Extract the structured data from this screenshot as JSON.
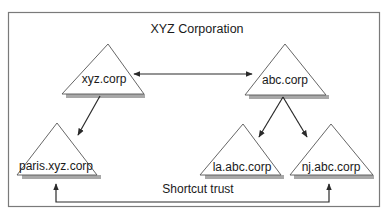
{
  "diagram": {
    "title": "XYZ Corporation",
    "nodes": [
      {
        "id": "xyz",
        "label": "xyz.corp"
      },
      {
        "id": "abc",
        "label": "abc.corp"
      },
      {
        "id": "paris",
        "label": "paris.xyz.corp"
      },
      {
        "id": "la",
        "label": "la.abc.corp"
      },
      {
        "id": "nj",
        "label": "nj.abc.corp"
      }
    ],
    "edges": [
      {
        "from": "xyz",
        "to": "abc",
        "type": "two-way"
      },
      {
        "from": "xyz",
        "to": "paris",
        "type": "one-way"
      },
      {
        "from": "abc",
        "to": "la",
        "type": "one-way"
      },
      {
        "from": "abc",
        "to": "nj",
        "type": "one-way"
      },
      {
        "from": "paris",
        "to": "nj",
        "type": "two-way",
        "label": "Shortcut trust"
      }
    ],
    "shortcut_label": "Shortcut trust",
    "colors": {
      "border": "#7a7a7a",
      "line": "#2a2a2a",
      "shadow": "#a8a8a8"
    }
  }
}
